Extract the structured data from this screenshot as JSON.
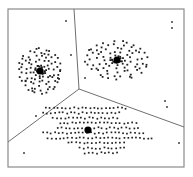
{
  "diagram": {
    "type": "voronoi-kmeans-clusters",
    "frame": {
      "x1": 8,
      "y1": 9,
      "x2": 184,
      "y2": 167,
      "stroke": "#8a8a8a"
    },
    "boundaries": {
      "junction": [
        79,
        89
      ],
      "endpoints": [
        [
          74,
          9
        ],
        [
          8,
          142
        ],
        [
          184,
          127
        ]
      ],
      "stroke": "#6f6f6f"
    },
    "point_color": "#222222",
    "centroid_color": "#000000",
    "clusters": [
      {
        "name": "cluster-left",
        "centroid": [
          40,
          71
        ],
        "shape": "ring",
        "radii": [
          6,
          10,
          14,
          18,
          21
        ],
        "counts": [
          10,
          14,
          18,
          22,
          26
        ],
        "sx": 1.0,
        "sy": 1.05,
        "rot": -0.3
      },
      {
        "name": "cluster-right",
        "centroid": [
          117,
          60
        ],
        "shape": "ring",
        "radii": [
          6,
          11,
          16,
          21,
          25
        ],
        "counts": [
          9,
          13,
          17,
          21,
          24
        ],
        "sx": 1.25,
        "sy": 0.75,
        "rot": 0.05
      },
      {
        "name": "cluster-bottom",
        "centroid": [
          88,
          130
        ],
        "shape": "grid",
        "rows": [
          {
            "dy": -22,
            "x0": -42,
            "x1": 38,
            "step": 4
          },
          {
            "dy": -17,
            "x0": -45,
            "x1": 32,
            "step": 4
          },
          {
            "dy": -12,
            "x0": -35,
            "x1": 30,
            "step": 4
          },
          {
            "dy": -7,
            "x0": -28,
            "x1": 48,
            "step": 4
          },
          {
            "dy": -2,
            "x0": -30,
            "x1": 50,
            "step": 4
          },
          {
            "dy": 3,
            "x0": -45,
            "x1": 58,
            "step": 4
          },
          {
            "dy": 8,
            "x0": -40,
            "x1": 65,
            "step": 4
          },
          {
            "dy": 13,
            "x0": -20,
            "x1": 38,
            "step": 4
          },
          {
            "dy": 18,
            "x0": -8,
            "x1": 36,
            "step": 4
          },
          {
            "dy": 23,
            "x0": -3,
            "x1": 30,
            "step": 4
          }
        ]
      }
    ],
    "outliers": [
      [
        66,
        21
      ],
      [
        71,
        55
      ],
      [
        85,
        78
      ],
      [
        172,
        22
      ],
      [
        172,
        28
      ],
      [
        165,
        101
      ],
      [
        167,
        107
      ],
      [
        36,
        116
      ],
      [
        24,
        153
      ],
      [
        179,
        143
      ]
    ]
  }
}
